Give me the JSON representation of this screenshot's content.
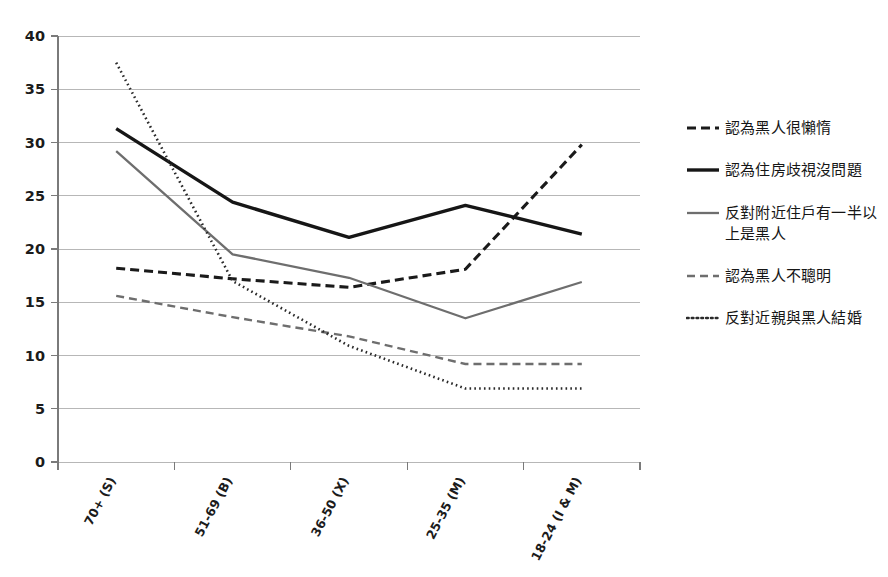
{
  "chart_data": {
    "type": "line",
    "title": "",
    "subtitle": "",
    "xlabel": "",
    "ylabel": "",
    "ylim": [
      0,
      40
    ],
    "ytick_step": 5,
    "yticks": [
      "0",
      "5",
      "10",
      "15",
      "20",
      "25",
      "30",
      "35",
      "40"
    ],
    "grid": true,
    "legend_position": "right",
    "categories": [
      "70+ (S)",
      "51-69 (B)",
      "36-50 (X)",
      "25-35 (M)",
      "18-24 (I & M)"
    ],
    "series": [
      {
        "name": "認為黑人很懶惰",
        "values": [
          18.2,
          17.2,
          16.4,
          18.1,
          29.8
        ],
        "color": "#1a1a1a",
        "style": "dashed",
        "width": 3.1,
        "dasharray": "9,5"
      },
      {
        "name": "認為住房歧視沒問題",
        "values": [
          31.3,
          24.4,
          21.1,
          24.1,
          21.4
        ],
        "color": "#161616",
        "style": "solid",
        "width": 3.4,
        "dasharray": ""
      },
      {
        "name": "反對附近住戶有一半以上是黑人",
        "values": [
          29.2,
          19.5,
          17.3,
          13.5,
          16.9
        ],
        "color": "#6e6e6e",
        "style": "solid",
        "width": 2.3,
        "dasharray": ""
      },
      {
        "name": "認為黑人不聰明",
        "values": [
          15.6,
          13.6,
          11.8,
          9.2,
          9.2
        ],
        "color": "#6e6e6e",
        "style": "dashed",
        "width": 2.4,
        "dasharray": "8,5"
      },
      {
        "name": "反對近親與黑人結婚",
        "values": [
          37.5,
          17.0,
          10.9,
          6.9,
          6.9
        ],
        "color": "#2a2a2a",
        "style": "dotted",
        "width": 2.6,
        "dasharray": "1.6,3.2"
      }
    ]
  },
  "legend": {
    "items": [
      {
        "label": "認為黑人很懶惰"
      },
      {
        "label": "認為住房歧視沒問題"
      },
      {
        "label": "反對附近住戶有一半以上是黑人"
      },
      {
        "label": "認為黑人不聰明"
      },
      {
        "label": "反對近親與黑人結婚"
      }
    ]
  }
}
